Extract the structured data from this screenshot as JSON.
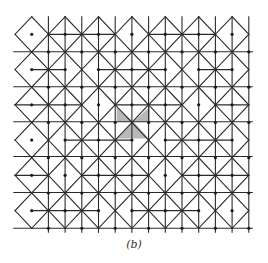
{
  "figure": {
    "caption": "(b)",
    "line_color": "#2a2a2a",
    "shade_color": "#b8b8b8",
    "node_color": "#1a1a1a",
    "grid": {
      "x0": 15.0,
      "y0": 16.7,
      "dx": 16.7,
      "dy": 17.63,
      "cols": 14,
      "rows": 12
    },
    "full_horizontal_rows_y": [
      51.7,
      86.7,
      121.7,
      156.5,
      192.5,
      228.3
    ],
    "shaded_triangles": [
      [
        [
          116.7,
          106.5
        ],
        [
          116.7,
          121.7
        ],
        [
          133.3,
          121.7
        ]
      ],
      [
        [
          150.0,
          106.5
        ],
        [
          150.0,
          121.7
        ],
        [
          133.3,
          121.7
        ]
      ],
      [
        [
          117.5,
          138.5
        ],
        [
          149.0,
          138.5
        ],
        [
          133.3,
          121.7
        ]
      ]
    ]
  }
}
